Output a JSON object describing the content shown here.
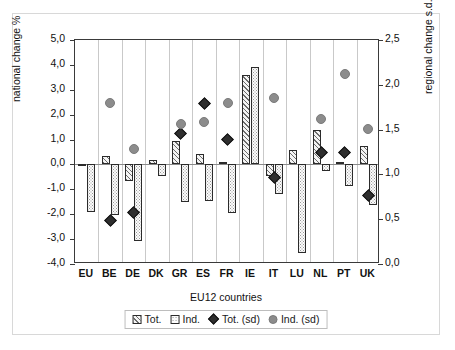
{
  "chart_data": {
    "type": "bar",
    "title": "",
    "xlabel": "EU12 countries",
    "ylabel": "national change %",
    "ylabel_secondary": "regional change s.d.",
    "grid": false,
    "legend_position": "bottom",
    "ylim": [
      -4.0,
      5.0
    ],
    "ylim_secondary": [
      0.0,
      2.5
    ],
    "yticks": [
      "5,0",
      "4,0",
      "3,0",
      "2,0",
      "1,0",
      "0,0",
      "-1,0",
      "-2,0",
      "-3,0",
      "-4,0"
    ],
    "ytick_values": [
      5.0,
      4.0,
      3.0,
      2.0,
      1.0,
      0.0,
      -1.0,
      -2.0,
      -3.0,
      -4.0
    ],
    "yticks_secondary": [
      "2,5",
      "2,0",
      "1,5",
      "1,0",
      "0,5",
      "0,0"
    ],
    "ytick_values_secondary": [
      2.5,
      2.0,
      1.5,
      1.0,
      0.5,
      0.0
    ],
    "categories": [
      "EU",
      "BE",
      "DE",
      "DK",
      "GR",
      "ES",
      "FR",
      "IE",
      "IT",
      "LU",
      "NL",
      "PT",
      "UK"
    ],
    "series": [
      {
        "name": "Tot.",
        "axis": "left",
        "kind": "bar",
        "values": [
          0.02,
          0.35,
          -0.65,
          0.17,
          0.95,
          0.4,
          0.1,
          3.6,
          -0.45,
          0.57,
          1.38,
          0.1,
          0.75
        ]
      },
      {
        "name": "Ind.",
        "axis": "left",
        "kind": "bar",
        "values": [
          -1.92,
          -2.05,
          -3.07,
          -0.48,
          -1.52,
          -1.45,
          -1.95,
          3.92,
          -1.18,
          -3.55,
          -0.25,
          -0.88,
          -1.62
        ]
      },
      {
        "name": "Tot. (sd)",
        "axis": "right",
        "kind": "marker-diamond",
        "values": [
          null,
          0.49,
          0.57,
          null,
          1.46,
          1.79,
          1.39,
          null,
          0.97,
          null,
          1.25,
          1.24,
          0.76
        ]
      },
      {
        "name": "Ind. (sd)",
        "axis": "right",
        "kind": "marker-circle",
        "values": [
          null,
          1.8,
          1.28,
          null,
          1.56,
          1.58,
          1.8,
          null,
          1.85,
          null,
          1.62,
          2.12,
          1.51
        ]
      }
    ]
  },
  "legend": {
    "items": [
      {
        "label": "Tot.",
        "swatch": "hatch-square-icon"
      },
      {
        "label": "Ind.",
        "swatch": "dotted-square-icon"
      },
      {
        "label": "Tot. (sd)",
        "swatch": "black-diamond-icon"
      },
      {
        "label": "Ind. (sd)",
        "swatch": "gray-circle-icon"
      }
    ]
  },
  "colors": {
    "marker_diamond": "#2e2e2e",
    "marker_circle": "#8c8c8c",
    "axis": "#3a3a3a",
    "gridline": "#c9c9c9",
    "frame": "#d8d8d8"
  }
}
